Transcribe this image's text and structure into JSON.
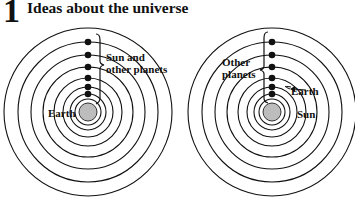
{
  "heading": {
    "number": "1",
    "title": "Ideas about the universe"
  },
  "diagrams": [
    {
      "name": "earth-centred-model",
      "center_label": "Earth",
      "bracket_label_lines": [
        "Sun and",
        "other planets"
      ]
    },
    {
      "name": "sun-centred-model",
      "center_label": "Sun",
      "bracket_label_lines": [
        "Other",
        "planets"
      ],
      "arrow_label": "Earth"
    }
  ],
  "colors": {
    "ink": "#111111",
    "body_fill": "#bdbdbd"
  }
}
